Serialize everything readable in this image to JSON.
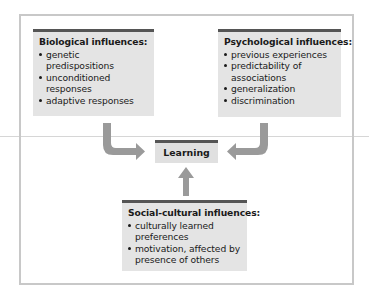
{
  "diagram": {
    "center": {
      "label": "Learning"
    },
    "biological": {
      "title": "Biological influences:",
      "items": [
        "genetic predispositions",
        "unconditioned responses",
        "adaptive responses"
      ]
    },
    "psychological": {
      "title": "Psychological influences:",
      "items": [
        "previous experiences",
        "predictability of associations",
        "generalization",
        "discrimination"
      ]
    },
    "social_cultural": {
      "title": "Social-cultural influences:",
      "items": [
        "culturally learned preferences",
        "motivation, affected by presence of others"
      ]
    },
    "colors": {
      "box_fill": "#e4e4e4",
      "box_top_rule": "#555555",
      "arrow": "#9a9a9a",
      "frame": "#c8c8c8"
    }
  }
}
